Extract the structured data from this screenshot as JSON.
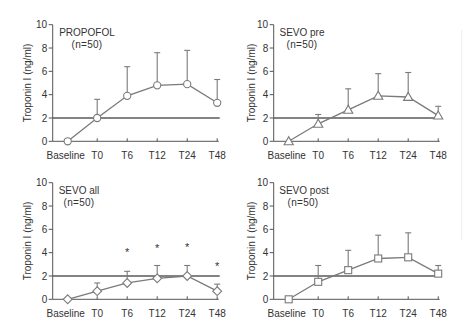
{
  "colors": {
    "data_line": "#7a7a7a",
    "axis": "#555555",
    "reference_line": "#5a5a5a",
    "text": "#333333",
    "marker_fill": "#ffffff",
    "background": "#ffffff"
  },
  "chart_data": [
    {
      "type": "line",
      "title": "PROPOFOL",
      "subtitle": "(n=50)",
      "xlabel": "",
      "ylabel": "Troponin I (ng/ml)",
      "ylim": [
        0,
        10
      ],
      "yticks": [
        0,
        2,
        4,
        6,
        8,
        10
      ],
      "grid": false,
      "legend": null,
      "categories": [
        "Baseline",
        "T0",
        "T6",
        "T12",
        "T24",
        "T48"
      ],
      "series": [
        {
          "name": "PROPOFOL",
          "marker": "circle",
          "values": [
            0,
            2.0,
            3.9,
            4.8,
            4.9,
            3.3
          ],
          "error_bar_top": [
            null,
            3.6,
            6.4,
            7.6,
            7.8,
            5.3
          ]
        }
      ],
      "reference_line": {
        "y": 2
      },
      "annotations": []
    },
    {
      "type": "line",
      "title": "SEVO pre",
      "subtitle": "(n=50)",
      "xlabel": "",
      "ylabel": "Troponin I (ng/ml)",
      "ylim": [
        0,
        10
      ],
      "yticks": [
        0,
        2,
        4,
        6,
        8,
        10
      ],
      "grid": false,
      "legend": null,
      "categories": [
        "Baseline",
        "T0",
        "T6",
        "T12",
        "T24",
        "T48"
      ],
      "series": [
        {
          "name": "SEVO pre",
          "marker": "triangle",
          "values": [
            0,
            1.5,
            2.7,
            3.9,
            3.8,
            2.2
          ],
          "error_bar_top": [
            null,
            2.3,
            4.5,
            5.8,
            5.9,
            3.0
          ]
        }
      ],
      "reference_line": {
        "y": 2
      },
      "annotations": []
    },
    {
      "type": "line",
      "title": "SEVO all",
      "subtitle": "(n=50)",
      "xlabel": "",
      "ylabel": "Troponin I (ng/ml)",
      "ylim": [
        0,
        10
      ],
      "yticks": [
        0,
        2,
        4,
        6,
        8,
        10
      ],
      "grid": false,
      "legend": null,
      "categories": [
        "Baseline",
        "T0",
        "T6",
        "T12",
        "T24",
        "T48"
      ],
      "series": [
        {
          "name": "SEVO all",
          "marker": "diamond",
          "values": [
            0,
            0.7,
            1.4,
            1.8,
            2.0,
            0.7
          ],
          "error_bar_top": [
            null,
            1.4,
            2.4,
            2.9,
            2.9,
            1.3
          ]
        }
      ],
      "reference_line": {
        "y": 2
      },
      "annotations": [
        {
          "category": "T6",
          "y": 4.2,
          "text": "*"
        },
        {
          "category": "T12",
          "y": 4.5,
          "text": "*"
        },
        {
          "category": "T24",
          "y": 4.6,
          "text": "*"
        },
        {
          "category": "T48",
          "y": 3.0,
          "text": "*"
        }
      ]
    },
    {
      "type": "line",
      "title": "SEVO post",
      "subtitle": "(n=50)",
      "xlabel": "",
      "ylabel": "Troponin I (ng/ml)",
      "ylim": [
        0,
        10
      ],
      "yticks": [
        0,
        2,
        4,
        6,
        8,
        10
      ],
      "grid": false,
      "legend": null,
      "categories": [
        "Baseline",
        "T0",
        "T6",
        "T12",
        "T24",
        "T48"
      ],
      "series": [
        {
          "name": "SEVO post",
          "marker": "square",
          "values": [
            0,
            1.5,
            2.5,
            3.5,
            3.6,
            2.2
          ],
          "error_bar_top": [
            null,
            2.9,
            4.2,
            5.5,
            5.7,
            2.9
          ]
        }
      ],
      "reference_line": {
        "y": 2
      },
      "annotations": []
    }
  ]
}
